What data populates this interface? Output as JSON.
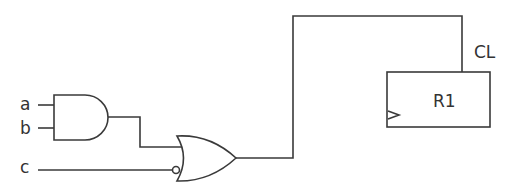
{
  "diagram": {
    "type": "logic-circuit",
    "inputs": [
      {
        "label": "a"
      },
      {
        "label": "b"
      },
      {
        "label": "c"
      }
    ],
    "gates": [
      {
        "id": "and1",
        "type": "AND",
        "inputs": [
          "a",
          "b"
        ]
      },
      {
        "id": "or1",
        "type": "OR",
        "inputs": [
          "and1",
          "NOT c"
        ],
        "inverted_input": "c"
      }
    ],
    "register": {
      "label": "R1",
      "clock_label": "CL",
      "clock_source": "or1"
    }
  }
}
